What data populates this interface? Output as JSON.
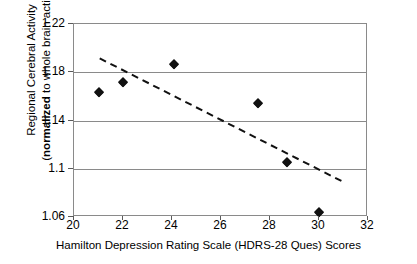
{
  "chart_data": {
    "type": "scatter",
    "title": "",
    "xlabel": "Hamilton Depression Rating Scale (HDRS-28 Ques) Scores",
    "ylabel_line1": "Regional Cerebral Activity",
    "ylabel_line2_bold": "normalized",
    "ylabel_line2_rest": " to whole brain activity)",
    "ylabel_line2_open": "(",
    "xlim": [
      20,
      32
    ],
    "ylim": [
      1.06,
      1.22
    ],
    "xticks": [
      "20",
      "22",
      "24",
      "26",
      "28",
      "30",
      "32"
    ],
    "xtick_values": [
      20,
      22,
      24,
      26,
      28,
      30,
      32
    ],
    "yticks": [
      "1.22",
      "1.18",
      "1.14",
      "1.1",
      "1.06"
    ],
    "ytick_values": [
      1.22,
      1.18,
      1.14,
      1.1,
      1.06
    ],
    "grid": "horizontal",
    "legend": "none",
    "marker": "filled-diamond",
    "marker_color": "#111111",
    "grid_color": "#8a8a8a",
    "points": [
      {
        "x": 21.0,
        "y": 1.1635
      },
      {
        "x": 22.0,
        "y": 1.172
      },
      {
        "x": 24.1,
        "y": 1.187
      },
      {
        "x": 27.5,
        "y": 1.1545
      },
      {
        "x": 28.7,
        "y": 1.106
      },
      {
        "x": 30.0,
        "y": 1.064
      }
    ],
    "trendline": {
      "style": "dashed",
      "color": "#111111",
      "x_start": 21.05,
      "y_start": 1.1915,
      "x_end": 30.95,
      "y_end": 1.0895
    }
  }
}
